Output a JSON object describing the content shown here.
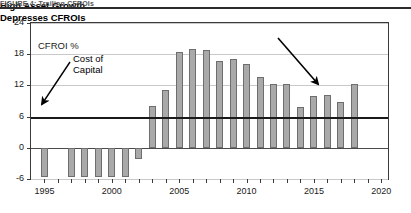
{
  "caption": "FIGURE 4:  Trailing CFROIs",
  "chart_data": {
    "type": "bar",
    "title": "",
    "xlabel": "",
    "ylabel": "CFROI %",
    "ylim": [
      -6,
      24
    ],
    "xlim": [
      1994,
      2020.5
    ],
    "yticks": [
      24,
      18,
      12,
      6,
      0,
      -6
    ],
    "xticks_labeled": [
      1995,
      2000,
      2005,
      2010,
      2015,
      2020
    ],
    "grid": true,
    "legend": "none",
    "series_name": "Trailing CFROI %",
    "categories": [
      1995,
      1997,
      1998,
      1999,
      2000,
      2001,
      2002,
      2003,
      2004,
      2005,
      2006,
      2007,
      2008,
      2009,
      2010,
      2011,
      2012,
      2013,
      2014,
      2015,
      2016,
      2017,
      2018
    ],
    "values": [
      -5.6,
      -5.6,
      -5.6,
      -5.6,
      -5.6,
      -5.6,
      -2.2,
      8.0,
      11.2,
      18.4,
      19.0,
      18.8,
      16.6,
      17.0,
      16.2,
      13.6,
      12.3,
      12.3,
      7.8,
      9.9,
      10.2,
      8.8,
      12.3
    ],
    "reference_lines": [
      {
        "value": 6,
        "label": "Cost of Capital",
        "style": "thick-solid"
      },
      {
        "value": 0,
        "label": "",
        "style": "thin-solid"
      }
    ],
    "annotations": [
      {
        "name": "cost-of-capital",
        "line1": "Cost of",
        "line2": "Capital",
        "points_to": 6
      },
      {
        "name": "high-asset-growth",
        "line1": "High Asset Growth",
        "line2": "Depresses CFROIs",
        "points_to": 2013
      }
    ]
  },
  "axis": {
    "y_labels": [
      "24",
      "18",
      "12",
      "6",
      "0",
      "-6"
    ],
    "x_labels": [
      "1995",
      "2000",
      "2005",
      "2010",
      "2015",
      "2020"
    ]
  },
  "labels": {
    "cfroi": "CFROI %",
    "cost_of_capital_l1": "Cost of",
    "cost_of_capital_l2": "Capital",
    "growth_l1": "High Asset Growth",
    "growth_l2": "Depresses CFROIs"
  }
}
